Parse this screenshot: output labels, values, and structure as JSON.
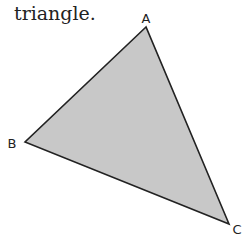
{
  "caption": "triangle.",
  "triangle": {
    "vertices": [
      {
        "label": "A",
        "x": 146,
        "y": 27,
        "lx": 146,
        "ly": 23
      },
      {
        "label": "B",
        "x": 25,
        "y": 142,
        "lx": 12,
        "ly": 148
      },
      {
        "label": "C",
        "x": 229,
        "y": 224,
        "lx": 237,
        "ly": 234
      }
    ],
    "fill": "#c8c8c8",
    "stroke": "#222222"
  }
}
